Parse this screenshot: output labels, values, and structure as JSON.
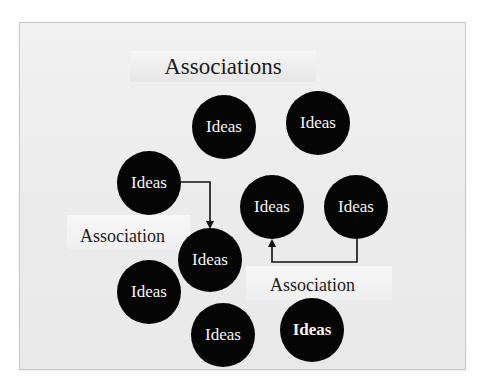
{
  "slide": {
    "title": "Associations",
    "ideas": [
      {
        "label": "Ideas",
        "bold": false
      },
      {
        "label": "Ideas",
        "bold": false
      },
      {
        "label": "Ideas",
        "bold": false
      },
      {
        "label": "Ideas",
        "bold": false
      },
      {
        "label": "Ideas",
        "bold": false
      },
      {
        "label": "Ideas",
        "bold": false
      },
      {
        "label": "Ideas",
        "bold": true
      },
      {
        "label": "Ideas",
        "bold": false
      },
      {
        "label": "Ideas",
        "bold": false
      }
    ],
    "association_labels": [
      "Association",
      "Association"
    ],
    "colors": {
      "circle": "#050505",
      "circle_text": "#f5f5f5",
      "background": "#eeeeee",
      "arrow": "#111111"
    }
  }
}
